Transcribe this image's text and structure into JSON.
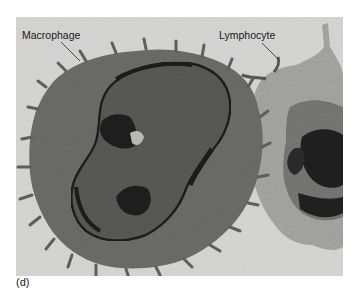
{
  "figure": {
    "panel_label": "(d)",
    "labels": {
      "macrophage": "Macrophage",
      "lymphocyte": "Lymphocyte"
    },
    "colors": {
      "background": "#d4d4d2",
      "cytoplasm_macrophage": "#6e6e6c",
      "cytoplasm_lymphocyte": "#a9a9a6",
      "nucleus": "#5a5a58",
      "heterochromatin": "#1e1e1e",
      "nuclear_envelope": "#222222"
    }
  }
}
